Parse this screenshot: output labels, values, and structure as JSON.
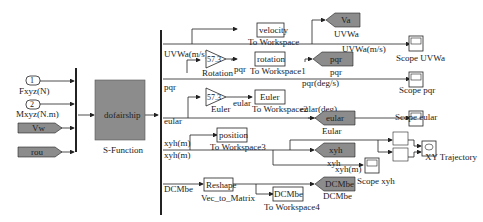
{
  "inputs": {
    "in1": {
      "num": "1",
      "label": "Fxyz(N)"
    },
    "in2": {
      "num": "2",
      "label": "Mxyz(N.m)"
    },
    "from_vw": "Vw",
    "from_rou": "rou"
  },
  "sfunction": {
    "name": "dofairship",
    "label": "S-Function"
  },
  "signals": {
    "uvwa": "UVWa(m/s)",
    "pqr": "pqr",
    "eular": "eular",
    "xyh1": "xyh(m)",
    "xyh2": "xyh(m)",
    "dcmbe": "DCMbe",
    "pqr_deg": "pqr(deg/s)",
    "eular_deg": "eular(deg)",
    "uvwa2": "UVWa(m/s)",
    "pqr_small": "pqr",
    "eular_small": "eular",
    "xyh3": "xyh(m)"
  },
  "gains": {
    "rotation": {
      "value": "57.3",
      "label": "Rotation"
    },
    "euler": {
      "value": "57.3",
      "label": "Euler"
    }
  },
  "to_workspace": [
    {
      "var": "velocity",
      "label": "To Workspace"
    },
    {
      "var": "rotation",
      "label": "To Workspace1"
    },
    {
      "var": "Euler",
      "label": "To Workspace2"
    },
    {
      "var": "position",
      "label": "To Workspace3"
    },
    {
      "var": "DCMbe",
      "label": "To Workspace4"
    }
  ],
  "reshape": {
    "name": "Reshape",
    "label": "Vec_to_Matrix"
  },
  "goto": [
    {
      "tag": "Va",
      "label": "UVWa"
    },
    {
      "tag": "pqr",
      "label": "pqr"
    },
    {
      "tag": "eular",
      "label": "Eular"
    },
    {
      "tag": "xyh",
      "label": "xyh"
    },
    {
      "tag": "DCMbe",
      "label": "DCMbe"
    }
  ],
  "scopes": [
    {
      "label": "Scope UVWa"
    },
    {
      "label": "Scope pqr"
    },
    {
      "label": "Scope eular"
    },
    {
      "label": "Scope xyh"
    },
    {
      "label": "XY Trajectory"
    }
  ],
  "colors": {
    "block_gray": "#8c8c8c",
    "line": "#222222"
  }
}
